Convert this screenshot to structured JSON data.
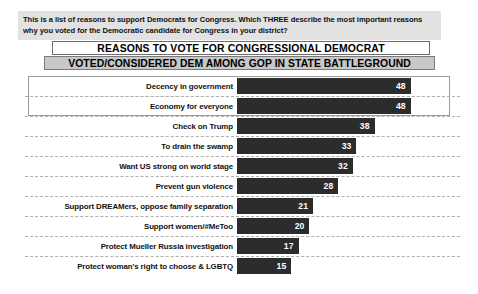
{
  "question": {
    "text": "This is a list of reasons to support Democrats for Congress. Which THREE describe the most important reasons why you voted for the Democratic candidate for Congress in your district?"
  },
  "titles": {
    "line1": "REASONS TO VOTE FOR CONGRESSIONAL DEMOCRAT",
    "line2": "VOTED/CONSIDERED DEM AMONG GOP IN STATE BATTLEGROUND"
  },
  "chart_data": {
    "type": "bar",
    "orientation": "horizontal",
    "title": "REASONS TO VOTE FOR CONGRESSIONAL DEMOCRAT",
    "subtitle": "VOTED/CONSIDERED DEM AMONG GOP IN STATE BATTLEGROUND",
    "xlabel": "",
    "ylabel": "",
    "xlim": [
      0,
      50
    ],
    "grid": true,
    "legend": false,
    "bar_color": "#2c2c2c",
    "value_label_color": "#ffffff",
    "categories": [
      "Decency in government",
      "Economy for everyone",
      "Check on Trump",
      "To drain the swamp",
      "Want US strong on world stage",
      "Prevent gun violence",
      "Support DREAMers, oppose family separation",
      "Support women/#MeToo",
      "Protect Mueller Russia investigation",
      "Protect woman's right to choose & LGBTQ"
    ],
    "values": [
      48,
      48,
      38,
      33,
      32,
      28,
      21,
      20,
      17,
      15
    ],
    "highlighted": [
      "Decency in government",
      "Economy for everyone"
    ]
  }
}
